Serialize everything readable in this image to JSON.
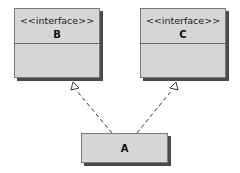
{
  "diagram": {
    "type": "UML class diagram",
    "classes": [
      {
        "id": "B",
        "stereotype": "<<interface>>",
        "name": "B"
      },
      {
        "id": "C",
        "stereotype": "<<interface>>",
        "name": "C"
      },
      {
        "id": "A",
        "name": "A"
      }
    ],
    "relations": [
      {
        "from": "A",
        "to": "B",
        "kind": "realization",
        "style": "dashed",
        "arrowhead": "hollow-triangle"
      },
      {
        "from": "A",
        "to": "C",
        "kind": "realization",
        "style": "dashed",
        "arrowhead": "hollow-triangle"
      }
    ]
  }
}
